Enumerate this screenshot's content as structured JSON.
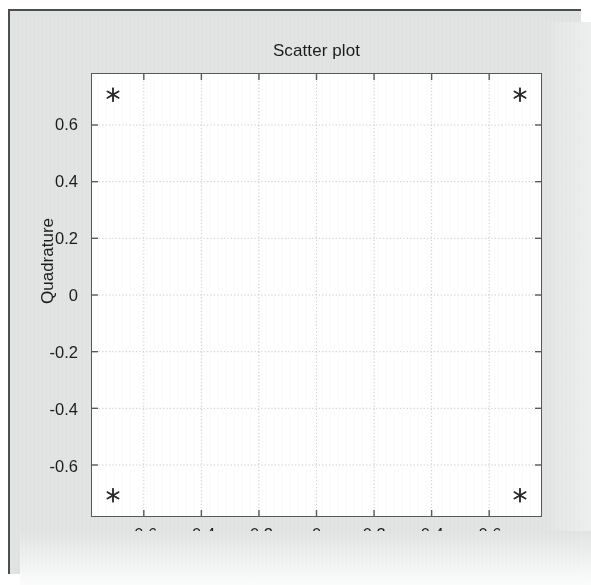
{
  "figure": {
    "background_color": "#e2e4e4",
    "frame_color": "#4a4f52",
    "plot_background_color": "#ffffff",
    "axis_color": "#58595b",
    "grid_color": "#c8cacb",
    "marker_color": "#2b2b2b",
    "text_color": "#1c1c1c"
  },
  "chart_data": {
    "type": "scatter",
    "title": "Scatter plot",
    "xlabel": "In-Phase",
    "ylabel": "Quadrature",
    "xlim": [
      -0.78,
      0.78
    ],
    "ylim": [
      -0.78,
      0.78
    ],
    "xticks": [
      -0.6,
      -0.4,
      -0.2,
      0,
      0.2,
      0.4,
      0.6
    ],
    "yticks": [
      -0.6,
      -0.4,
      -0.2,
      0,
      0.2,
      0.4,
      0.6
    ],
    "xtick_labels": [
      "-0.6",
      "-0.4",
      "-0.2",
      "0",
      "0.2",
      "0.4",
      "0.6"
    ],
    "ytick_labels": [
      "-0.6",
      "-0.4",
      "-0.2",
      "0",
      "0.2",
      "0.4",
      "0.6"
    ],
    "grid": true,
    "grid_style": "dotted",
    "legend": null,
    "marker": "asterisk",
    "series": [
      {
        "name": "constellation",
        "points": [
          {
            "x": -0.707,
            "y": 0.707
          },
          {
            "x": 0.707,
            "y": 0.707
          },
          {
            "x": -0.707,
            "y": -0.707
          },
          {
            "x": 0.707,
            "y": -0.707
          }
        ]
      }
    ]
  }
}
